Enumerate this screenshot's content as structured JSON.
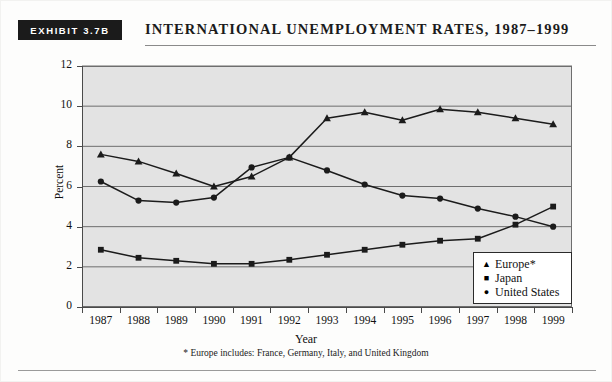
{
  "header": {
    "exhibit_tag": "EXHIBIT 3.7B",
    "title": "INTERNATIONAL UNEMPLOYMENT RATES, 1987–1999"
  },
  "footnote": "* Europe includes: France, Germany, Italy, and United Kingdom",
  "legend": {
    "items": [
      {
        "marker": "▲",
        "label": "Europe*"
      },
      {
        "marker": "■",
        "label": "Japan"
      },
      {
        "marker": "●",
        "label": "United States"
      }
    ]
  },
  "colors": {
    "plot_background": "#e3e3e3",
    "line": "#1b1b1b",
    "grid": "#6e6e6e",
    "axis": "#4a4a4a",
    "tag_background": "#1b1b1b",
    "tag_text": "#ffffff"
  },
  "chart_data": {
    "type": "line",
    "title": "INTERNATIONAL UNEMPLOYMENT RATES, 1987–1999",
    "xlabel": "Year",
    "ylabel": "Percent",
    "categories": [
      "1987",
      "1988",
      "1989",
      "1990",
      "1991",
      "1992",
      "1993",
      "1994",
      "1995",
      "1996",
      "1997",
      "1998",
      "1999"
    ],
    "x": [
      1987,
      1988,
      1989,
      1990,
      1991,
      1992,
      1993,
      1994,
      1995,
      1996,
      1997,
      1998,
      1999
    ],
    "ylim": [
      0,
      12
    ],
    "yticks": [
      0,
      2,
      4,
      6,
      8,
      10,
      12
    ],
    "grid": true,
    "legend_position": "bottom-right",
    "series": [
      {
        "name": "Europe*",
        "marker": "triangle",
        "values": [
          7.6,
          7.25,
          6.65,
          6.0,
          6.5,
          7.45,
          9.4,
          9.7,
          9.3,
          9.85,
          9.7,
          9.4,
          9.1
        ]
      },
      {
        "name": "Japan",
        "marker": "square",
        "values": [
          2.85,
          2.45,
          2.3,
          2.15,
          2.15,
          2.35,
          2.6,
          2.85,
          3.1,
          3.3,
          3.4,
          4.1,
          5.0
        ]
      },
      {
        "name": "United States",
        "marker": "circle",
        "values": [
          6.25,
          5.3,
          5.2,
          5.45,
          6.95,
          7.45,
          6.8,
          6.1,
          5.55,
          5.4,
          4.9,
          4.5,
          4.0
        ]
      }
    ]
  }
}
